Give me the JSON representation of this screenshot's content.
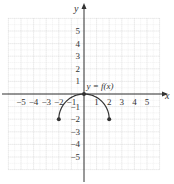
{
  "chart_data": {
    "type": "line",
    "title": "",
    "xlabel": "x",
    "ylabel": "y",
    "xlim": [
      -6,
      6
    ],
    "ylim": [
      -6,
      6
    ],
    "grid": true,
    "x_ticks": [
      -5,
      -4,
      -3,
      -2,
      -1,
      1,
      2,
      3,
      4,
      5
    ],
    "y_ticks": [
      5,
      4,
      3,
      2,
      1,
      -1,
      -2,
      -3,
      -4,
      -5
    ],
    "x_tick_labels": [
      "−5",
      "−4",
      "−3",
      "−2",
      "−1",
      "1",
      "2",
      "3",
      "4",
      "5"
    ],
    "y_tick_labels": [
      "5",
      "4",
      "3",
      "2",
      "1",
      "−1",
      "−2",
      "−3",
      "−4",
      "−5"
    ],
    "series": [
      {
        "name": "y = f(x)",
        "description": "upper semicircle centered at (0,-2) with radius 2",
        "center": [
          0,
          -2
        ],
        "radius": 2,
        "x_domain": [
          -2,
          2
        ],
        "points": [
          [
            -2,
            -2
          ],
          [
            0,
            0
          ],
          [
            2,
            -2
          ]
        ],
        "closed_endpoints": [
          [
            -2,
            -2
          ],
          [
            0,
            0
          ],
          [
            2,
            -2
          ]
        ]
      }
    ],
    "annotations": [
      {
        "text": "y = f(x)",
        "x": 0.2,
        "y": 0.4
      }
    ]
  }
}
